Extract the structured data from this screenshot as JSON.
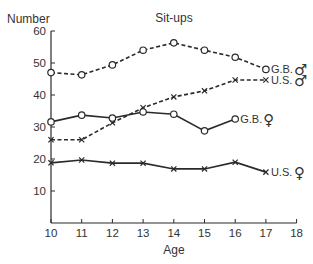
{
  "chart_data": {
    "type": "line",
    "title": "Sit-ups",
    "xlabel": "Age",
    "ylabel": "Number",
    "xlim": [
      10,
      18
    ],
    "ylim": [
      0,
      60
    ],
    "x_ticks": [
      10,
      11,
      12,
      13,
      14,
      15,
      16,
      17,
      18
    ],
    "y_ticks": [
      10,
      20,
      30,
      40,
      50,
      60
    ],
    "grid": false,
    "legend_position": "inline labels at line ends",
    "x": [
      10,
      11,
      12,
      13,
      14,
      15,
      16,
      17
    ],
    "series": [
      {
        "name": "G.B. ♂",
        "label": "G.B.",
        "sex_symbol": "♂",
        "marker": "circle",
        "line": "dashed",
        "x": [
          10,
          11,
          12,
          13,
          14,
          15,
          16,
          17
        ],
        "values": [
          47,
          46.3,
          49.4,
          54,
          56.3,
          54,
          51.8,
          48
        ]
      },
      {
        "name": "U.S. ♂",
        "label": "U.S.",
        "sex_symbol": "♂",
        "marker": "x",
        "line": "dashed",
        "x": [
          10,
          11,
          12,
          13,
          14,
          15,
          16,
          17
        ],
        "values": [
          26,
          26,
          31.3,
          36,
          39.4,
          41.3,
          44.7,
          44.7
        ]
      },
      {
        "name": "G.B. ♀",
        "label": "G.B.",
        "sex_symbol": "♀",
        "marker": "circle",
        "line": "solid",
        "x": [
          10,
          11,
          12,
          13,
          14,
          15,
          16
        ],
        "values": [
          31.6,
          33.7,
          32.8,
          34.7,
          34,
          28.8,
          32.5
        ]
      },
      {
        "name": "U.S. ♀",
        "label": "U.S.",
        "sex_symbol": "♀",
        "marker": "x",
        "line": "solid",
        "x": [
          10,
          11,
          12,
          13,
          14,
          15,
          16,
          17
        ],
        "values": [
          18.8,
          19.7,
          18.7,
          18.7,
          16.9,
          16.9,
          19,
          15.9
        ]
      }
    ]
  }
}
